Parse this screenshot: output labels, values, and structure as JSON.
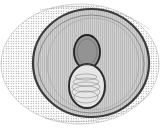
{
  "figure": {
    "colors": {
      "background": "#ffffff",
      "outer_shell": "#9a9a9a",
      "middle_shell": "#555555",
      "inner_shell_fill": "#c8c8c8",
      "core_body": "#3a3a3a",
      "core_highlight": "#e8e8e8"
    },
    "components": [
      {
        "name": "outer-shell",
        "shape": "ellipse",
        "cx": 80,
        "cy": 64,
        "rx": 80,
        "ry": 60
      },
      {
        "name": "middle-shell",
        "shape": "ellipse",
        "cx": 90,
        "cy": 63,
        "rx": 58,
        "ry": 55
      },
      {
        "name": "core-upper-lobe",
        "shape": "ellipse",
        "cx": 87,
        "cy": 51,
        "rx": 13,
        "ry": 16
      },
      {
        "name": "core-lower-lobe",
        "shape": "ellipse",
        "cx": 87,
        "cy": 86,
        "rx": 17,
        "ry": 20
      }
    ]
  }
}
